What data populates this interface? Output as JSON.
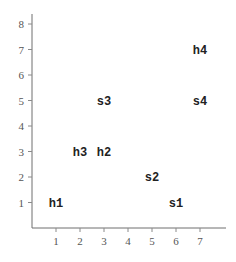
{
  "chart_data": {
    "type": "scatter",
    "title": "",
    "xlabel": "",
    "ylabel": "",
    "xlim": [
      0,
      8
    ],
    "ylim": [
      0,
      8.5
    ],
    "x_ticks": [
      1,
      2,
      3,
      4,
      5,
      6,
      7
    ],
    "y_ticks": [
      1,
      2,
      3,
      4,
      5,
      6,
      7,
      8
    ],
    "grid": false,
    "markers": "text-labels",
    "points": [
      {
        "label": "h1",
        "x": 1,
        "y": 1
      },
      {
        "label": "h2",
        "x": 3,
        "y": 3
      },
      {
        "label": "h3",
        "x": 2,
        "y": 3
      },
      {
        "label": "h4",
        "x": 7,
        "y": 7
      },
      {
        "label": "s1",
        "x": 6,
        "y": 1
      },
      {
        "label": "s2",
        "x": 5,
        "y": 2
      },
      {
        "label": "s3",
        "x": 3,
        "y": 5
      },
      {
        "label": "s4",
        "x": 7,
        "y": 5
      }
    ]
  }
}
